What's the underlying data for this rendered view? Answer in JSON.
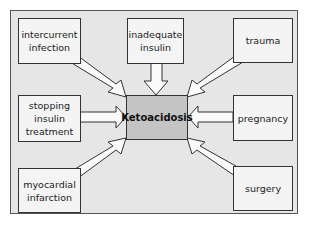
{
  "diagram": {
    "type": "cause-effect",
    "center": {
      "label": "Ketoacidosis"
    },
    "causes": [
      {
        "id": "intercurrent-infection",
        "label": "intercurrent\ninfection"
      },
      {
        "id": "inadequate-insulin",
        "label": "inadequate\ninsulin"
      },
      {
        "id": "trauma",
        "label": "trauma"
      },
      {
        "id": "stopping-insulin-treatment",
        "label": "stopping\ninsulin\ntreatment"
      },
      {
        "id": "pregnancy",
        "label": "pregnancy"
      },
      {
        "id": "myocardial-infarction",
        "label": "myocardial\ninfarction"
      },
      {
        "id": "surgery",
        "label": "surgery"
      }
    ],
    "colors": {
      "background": "#e6e6e6",
      "box": "#f4f4f4",
      "center": "#c4c4c4",
      "stroke": "#333333"
    }
  }
}
